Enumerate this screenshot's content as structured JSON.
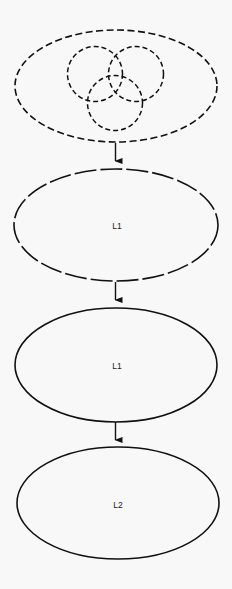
{
  "diagram": {
    "background": "#f8f8f8",
    "stroke_color": "#111111",
    "nodes": [
      {
        "id": "set-union",
        "label": "",
        "shape": "ellipse",
        "style": "dashed",
        "contains": [
          "circle-a",
          "circle-b",
          "circle-c"
        ]
      },
      {
        "id": "l1-dashed",
        "label": "L1",
        "shape": "ellipse",
        "style": "long-dashed"
      },
      {
        "id": "l1-solid",
        "label": "L1",
        "shape": "ellipse",
        "style": "solid"
      },
      {
        "id": "l2-solid",
        "label": "L2",
        "shape": "ellipse",
        "style": "solid"
      }
    ],
    "inner_circles": [
      {
        "id": "circle-a",
        "position": "upper-left",
        "style": "dashed"
      },
      {
        "id": "circle-b",
        "position": "upper-right",
        "style": "dashed"
      },
      {
        "id": "circle-c",
        "position": "bottom",
        "style": "dashed"
      }
    ],
    "edges": [
      {
        "from": "set-union",
        "to": "l1-dashed",
        "type": "arrow"
      },
      {
        "from": "l1-dashed",
        "to": "l1-solid",
        "type": "arrow"
      },
      {
        "from": "l1-solid",
        "to": "l2-solid",
        "type": "arrow"
      }
    ]
  }
}
